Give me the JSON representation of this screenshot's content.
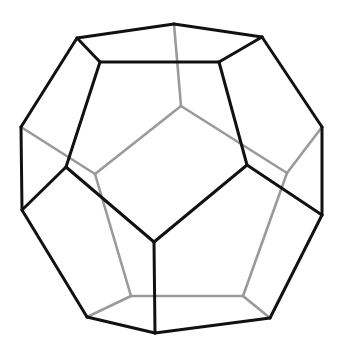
{
  "figure": {
    "colors": {
      "front_edges": "#111111",
      "hidden_edges": "#9a9a9a",
      "background": "#ffffff"
    },
    "vertices": {
      "A": [
        77,
        38
      ],
      "B": [
        174,
        24
      ],
      "C": [
        262,
        37
      ],
      "D": [
        100,
        62
      ],
      "E": [
        219,
        62
      ],
      "F": [
        21,
        127
      ],
      "G": [
        322,
        127
      ],
      "H": [
        66,
        167
      ],
      "I": [
        247,
        165
      ],
      "J": [
        22,
        210
      ],
      "K": [
        322,
        215
      ],
      "L": [
        154,
        242
      ],
      "M": [
        87,
        317
      ],
      "N": [
        155,
        333
      ],
      "O": [
        270,
        318
      ],
      "P": [
        181,
        106
      ],
      "Q": [
        95,
        174
      ],
      "R": [
        287,
        173
      ],
      "S": [
        131,
        296
      ],
      "T": [
        243,
        296
      ]
    },
    "front_edges": [
      [
        "A",
        "B"
      ],
      [
        "B",
        "C"
      ],
      [
        "A",
        "D"
      ],
      [
        "D",
        "E"
      ],
      [
        "E",
        "C"
      ],
      [
        "A",
        "F"
      ],
      [
        "C",
        "G"
      ],
      [
        "D",
        "H"
      ],
      [
        "E",
        "I"
      ],
      [
        "F",
        "J"
      ],
      [
        "G",
        "K"
      ],
      [
        "H",
        "J"
      ],
      [
        "I",
        "K"
      ],
      [
        "H",
        "L"
      ],
      [
        "I",
        "L"
      ],
      [
        "L",
        "N"
      ],
      [
        "J",
        "M"
      ],
      [
        "M",
        "N"
      ],
      [
        "N",
        "O"
      ],
      [
        "K",
        "O"
      ]
    ],
    "hidden_edges": [
      [
        "B",
        "P"
      ],
      [
        "P",
        "Q"
      ],
      [
        "P",
        "R"
      ],
      [
        "F",
        "Q"
      ],
      [
        "G",
        "R"
      ],
      [
        "Q",
        "S"
      ],
      [
        "R",
        "T"
      ],
      [
        "S",
        "T"
      ],
      [
        "S",
        "M"
      ],
      [
        "T",
        "O"
      ]
    ]
  }
}
